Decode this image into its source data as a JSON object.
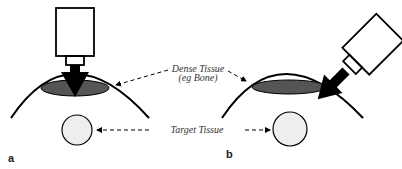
{
  "diagram": {
    "panels": [
      {
        "id": "a",
        "label": "a",
        "description": "Transducer perpendicular, beam passes through dense tissue"
      },
      {
        "id": "b",
        "label": "b",
        "description": "Transducer angled, beam avoids dense tissue"
      }
    ],
    "labels": {
      "dense_tissue_line1": "Dense Tissue",
      "dense_tissue_line2": "(eg Bone)",
      "target_tissue": "Target Tissue"
    },
    "colors": {
      "stroke": "#000000",
      "dense_tissue_fill": "#555555",
      "target_fill": "#eeeeee",
      "label_text": "#333333"
    }
  }
}
